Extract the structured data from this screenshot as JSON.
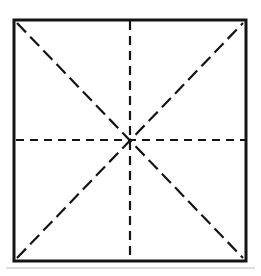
{
  "figure": {
    "name": "square-crease-pattern",
    "title": "Square with diagonal and bisector fold lines",
    "canvas": {
      "width": 261,
      "height": 276,
      "background": "#ffffff"
    },
    "colors": {
      "ink": "#141414",
      "background": "#ffffff",
      "scan_artifact": "#c8c8c8"
    }
  },
  "chart_data": {
    "type": "diagram",
    "title": "Square with diagonal and bisector fold lines",
    "shapes": [
      {
        "id": "outer-square",
        "kind": "square",
        "style": "solid",
        "stroke": "#141414",
        "stroke_width": 3,
        "corners": {
          "top_left": [
            14,
            20
          ],
          "top_right": [
            246,
            20
          ],
          "bottom_right": [
            246,
            261
          ],
          "bottom_left": [
            14,
            261
          ]
        }
      },
      {
        "id": "diagonal-tl-br",
        "kind": "line",
        "style": "dashed",
        "stroke": "#141414",
        "stroke_width": 2.2,
        "dash": [
          13,
          6
        ],
        "from": [
          17,
          23
        ],
        "to": [
          243,
          258
        ]
      },
      {
        "id": "diagonal-bl-tr",
        "kind": "line",
        "style": "dashed",
        "stroke": "#141414",
        "stroke_width": 2.2,
        "dash": [
          13,
          6
        ],
        "from": [
          17,
          258
        ],
        "to": [
          243,
          23
        ]
      },
      {
        "id": "vertical-bisector",
        "kind": "line",
        "style": "dashed",
        "stroke": "#141414",
        "stroke_width": 2.2,
        "dash": [
          9,
          6
        ],
        "from": [
          130,
          21
        ],
        "to": [
          130,
          260
        ]
      },
      {
        "id": "horizontal-bisector",
        "kind": "line",
        "style": "dashed",
        "stroke": "#141414",
        "stroke_width": 2.2,
        "dash": [
          8,
          6
        ],
        "from": [
          16,
          140
        ],
        "to": [
          245,
          140
        ]
      }
    ],
    "intersection_point": [
      130,
      140
    ],
    "line_count": 4,
    "ray_count": 8,
    "xlim": [
      0,
      261
    ],
    "ylim": [
      0,
      276
    ],
    "grid": false,
    "legend": null,
    "labels": [],
    "annotations": []
  }
}
